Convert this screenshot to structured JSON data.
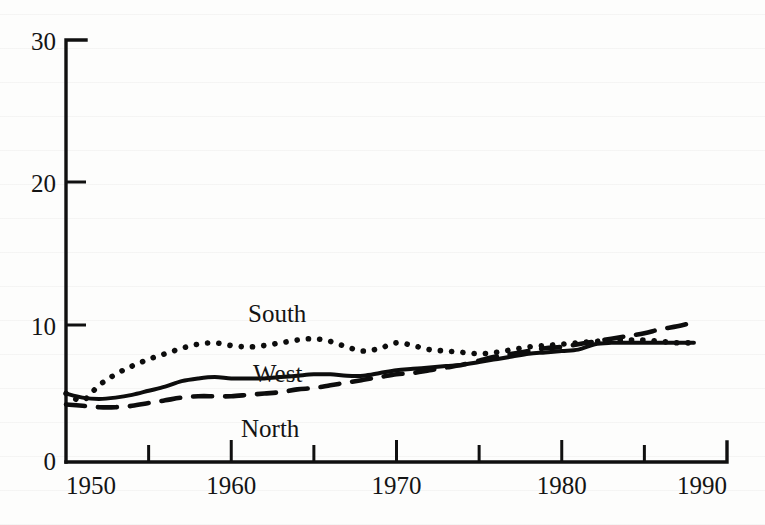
{
  "figure": {
    "background_color": "#fdfdfc",
    "ink_color": "#0d0d0d"
  },
  "axis": {
    "y_ticks": [
      "0",
      "10",
      "20",
      "30"
    ],
    "x_ticks": [
      "1950",
      "1960",
      "1970",
      "1980",
      "1990"
    ],
    "x_minor_ticks": [
      "1955",
      "1965",
      "1975",
      "1985"
    ]
  },
  "labels": {
    "south": "South",
    "west": "West",
    "north": "North"
  },
  "chart_data": {
    "type": "line",
    "title": "",
    "xlabel": "",
    "ylabel": "",
    "xlim": [
      1950,
      1990
    ],
    "ylim": [
      0,
      30
    ],
    "yticks": [
      0,
      10,
      20,
      30
    ],
    "xticks": [
      1950,
      1955,
      1960,
      1965,
      1970,
      1975,
      1980,
      1985,
      1990
    ],
    "xtick_labels_shown": [
      1950,
      1960,
      1970,
      1980,
      1990
    ],
    "grid": false,
    "legend": "inline-annotations",
    "x": [
      1950,
      1951,
      1952,
      1953,
      1954,
      1955,
      1956,
      1957,
      1958,
      1959,
      1960,
      1961,
      1962,
      1963,
      1964,
      1965,
      1966,
      1967,
      1968,
      1969,
      1970,
      1971,
      1972,
      1973,
      1974,
      1975,
      1976,
      1977,
      1978,
      1979,
      1980,
      1981,
      1982,
      1983,
      1984,
      1985,
      1986,
      1987,
      1988
    ],
    "series": [
      {
        "name": "South",
        "style": "dotted",
        "values": [
          5.0,
          4.5,
          5.6,
          6.4,
          7.0,
          7.5,
          7.9,
          8.3,
          8.6,
          8.7,
          8.5,
          8.4,
          8.5,
          8.7,
          8.9,
          9.0,
          8.8,
          8.4,
          8.1,
          8.3,
          8.7,
          8.5,
          8.2,
          8.1,
          8.0,
          7.9,
          8.0,
          8.2,
          8.4,
          8.5,
          8.6,
          8.7,
          8.8,
          8.9,
          8.9,
          8.9,
          8.8,
          8.7,
          8.7
        ]
      },
      {
        "name": "West",
        "style": "solid",
        "values": [
          5.0,
          4.7,
          4.6,
          4.7,
          4.9,
          5.2,
          5.5,
          5.9,
          6.1,
          6.2,
          6.1,
          6.1,
          6.1,
          6.2,
          6.3,
          6.4,
          6.4,
          6.3,
          6.3,
          6.5,
          6.7,
          6.8,
          6.9,
          7.0,
          7.1,
          7.3,
          7.5,
          7.7,
          7.9,
          8.0,
          8.1,
          8.2,
          8.6,
          8.7,
          8.7,
          8.7,
          8.7,
          8.7,
          8.7
        ]
      },
      {
        "name": "North",
        "style": "dashed",
        "values": [
          4.2,
          4.1,
          4.0,
          4.0,
          4.1,
          4.3,
          4.5,
          4.7,
          4.8,
          4.8,
          4.8,
          4.9,
          5.0,
          5.1,
          5.3,
          5.4,
          5.6,
          5.8,
          6.0,
          6.2,
          6.4,
          6.5,
          6.7,
          6.9,
          7.1,
          7.4,
          7.7,
          7.9,
          8.1,
          8.3,
          8.4,
          8.6,
          8.8,
          9.0,
          9.2,
          9.4,
          9.7,
          9.9,
          10.2
        ]
      }
    ]
  }
}
